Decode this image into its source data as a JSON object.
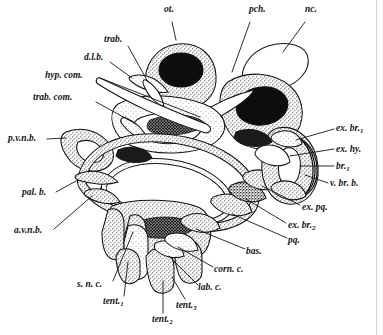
{
  "figure": {
    "style": "stippled pen and ink",
    "background_color": "#ffffff",
    "ink_color": "#151515",
    "stipple_color": "#3a3a3a"
  },
  "labels": [
    {
      "id": "ot",
      "text": "ot.",
      "sub": "",
      "x": 164,
      "y": 12,
      "anchor": "start",
      "leader": [
        [
          172,
          22
        ],
        [
          176,
          40
        ]
      ]
    },
    {
      "id": "pch",
      "text": "pch.",
      "sub": "",
      "x": 249,
      "y": 12,
      "anchor": "start",
      "leader": [
        [
          250,
          22
        ],
        [
          232,
          72
        ]
      ]
    },
    {
      "id": "nc",
      "text": "nc.",
      "sub": "",
      "x": 305,
      "y": 12,
      "anchor": "start",
      "leader": [
        [
          305,
          22
        ],
        [
          283,
          52
        ]
      ]
    },
    {
      "id": "trab",
      "text": "trab.",
      "sub": "",
      "x": 104,
      "y": 42,
      "anchor": "start",
      "leader": [
        [
          128,
          46
        ],
        [
          148,
          82
        ]
      ]
    },
    {
      "id": "dlb",
      "text": "d.l.b.",
      "sub": "",
      "x": 84,
      "y": 60,
      "anchor": "start",
      "leader": [
        [
          110,
          62
        ],
        [
          132,
          78
        ]
      ]
    },
    {
      "id": "hyp_com",
      "text": "hyp. com.",
      "sub": "",
      "x": 45,
      "y": 78,
      "anchor": "start",
      "leader": [
        [
          100,
          78
        ],
        [
          200,
          117
        ]
      ]
    },
    {
      "id": "trab_com",
      "text": "trab. com.",
      "sub": "",
      "x": 33,
      "y": 100,
      "anchor": "start",
      "leader": [
        [
          96,
          102
        ],
        [
          136,
          124
        ]
      ]
    },
    {
      "id": "pvnb",
      "text": "p.v.n.b.",
      "sub": "",
      "x": 8,
      "y": 141,
      "anchor": "start",
      "leader": [
        [
          47,
          139
        ],
        [
          66,
          138
        ]
      ]
    },
    {
      "id": "palb",
      "text": "pal. b.",
      "sub": "",
      "x": 22,
      "y": 195,
      "anchor": "start",
      "leader": [
        [
          56,
          192
        ],
        [
          78,
          180
        ]
      ]
    },
    {
      "id": "avnb",
      "text": "a.v.n.b.",
      "sub": "",
      "x": 14,
      "y": 233,
      "anchor": "start",
      "leader": [
        [
          54,
          229
        ],
        [
          92,
          196
        ]
      ]
    },
    {
      "id": "snc",
      "text": "s. n. c.",
      "sub": "",
      "x": 77,
      "y": 287,
      "anchor": "start",
      "leader": [
        [
          113,
          281
        ],
        [
          133,
          232
        ]
      ]
    },
    {
      "id": "tent1",
      "text": "tent.",
      "sub": "1",
      "x": 103,
      "y": 304,
      "anchor": "start",
      "leader": [
        [
          124,
          296
        ],
        [
          128,
          262
        ]
      ]
    },
    {
      "id": "tent2",
      "text": "tent.",
      "sub": "2",
      "x": 152,
      "y": 322,
      "anchor": "start",
      "leader": [
        [
          163,
          313
        ],
        [
          163,
          281
        ]
      ]
    },
    {
      "id": "tent3",
      "text": "tent.",
      "sub": "3",
      "x": 176,
      "y": 308,
      "anchor": "start",
      "leader": [
        [
          185,
          299
        ],
        [
          172,
          277
        ]
      ]
    },
    {
      "id": "lab_c",
      "text": "lab. c.",
      "sub": "",
      "x": 198,
      "y": 290,
      "anchor": "start",
      "leader": [
        [
          198,
          285
        ],
        [
          169,
          256
        ]
      ]
    },
    {
      "id": "corn_c",
      "text": "corn. c.",
      "sub": "",
      "x": 214,
      "y": 272,
      "anchor": "start",
      "leader": [
        [
          213,
          267
        ],
        [
          178,
          247
        ]
      ]
    },
    {
      "id": "bas",
      "text": "bas.",
      "sub": "",
      "x": 246,
      "y": 254,
      "anchor": "start",
      "leader": [
        [
          245,
          249
        ],
        [
          196,
          229
        ]
      ]
    },
    {
      "id": "pq",
      "text": "pq.",
      "sub": "",
      "x": 288,
      "y": 243,
      "anchor": "start",
      "leader": [
        [
          287,
          238
        ],
        [
          232,
          214
        ]
      ]
    },
    {
      "id": "exbr2",
      "text": "ex. br.",
      "sub": "2",
      "x": 288,
      "y": 228,
      "anchor": "start",
      "leader": [
        [
          286,
          223
        ],
        [
          246,
          199
        ]
      ]
    },
    {
      "id": "expq",
      "text": "ex. pq.",
      "sub": "",
      "x": 302,
      "y": 210,
      "anchor": "start",
      "leader": [
        [
          300,
          205
        ],
        [
          262,
          186
        ]
      ]
    },
    {
      "id": "vbrb",
      "text": "v. br. b.",
      "sub": "",
      "x": 330,
      "y": 186,
      "anchor": "start",
      "leader": [
        [
          328,
          183
        ],
        [
          305,
          175
        ]
      ]
    },
    {
      "id": "br1",
      "text": "br.",
      "sub": "1",
      "x": 336,
      "y": 169,
      "anchor": "start",
      "leader": [
        [
          334,
          166
        ],
        [
          300,
          166
        ]
      ]
    },
    {
      "id": "exhy",
      "text": "ex. hy.",
      "sub": "",
      "x": 336,
      "y": 152,
      "anchor": "start",
      "leader": [
        [
          334,
          149
        ],
        [
          290,
          156
        ]
      ]
    },
    {
      "id": "exbr1",
      "text": "ex. br.",
      "sub": "1",
      "x": 336,
      "y": 131,
      "anchor": "start",
      "leader": [
        [
          334,
          129
        ],
        [
          296,
          140
        ]
      ]
    }
  ]
}
